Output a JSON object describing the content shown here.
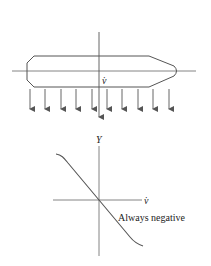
{
  "top_diagram": {
    "velocity_label": "v̇",
    "arrow_count": 10
  },
  "bottom_graph": {
    "y_axis_label": "Y",
    "x_axis_label": "v̇",
    "annotation": "Always negative"
  },
  "colors": {
    "line": "#555555",
    "text": "#222222"
  }
}
